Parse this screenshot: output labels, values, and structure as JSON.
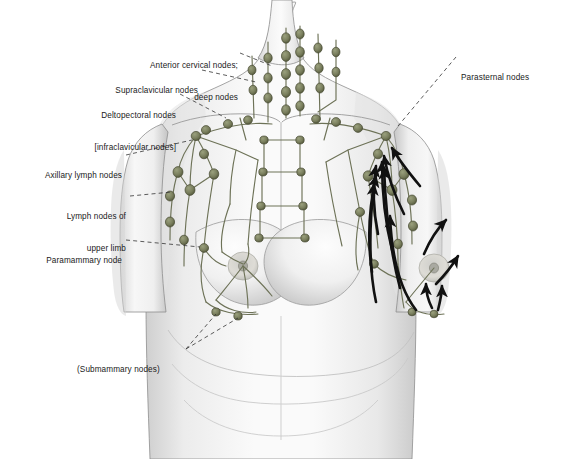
{
  "figure": {
    "background_color": "#ffffff",
    "node_color": "#7a7f5e",
    "node_outline_color": "#474a33",
    "vessel_color": "#6d7257",
    "arrow_color": "#111111",
    "skin_light": "#f4f4f4",
    "skin_shadow": "#c9c9c9",
    "leader_color": "#333333",
    "text_color": "#1a1a1a"
  },
  "labels": {
    "anterior_cervical": {
      "line1": "Anterior cervical nodes;",
      "line2": "deep nodes"
    },
    "supraclavicular": {
      "line1": "Supraclavicular nodes"
    },
    "deltopectoral": {
      "line1": "Deltopectoral nodes",
      "line2": "[infraclavicular nodes]"
    },
    "axillary": {
      "line1": "Axillary lymph nodes"
    },
    "upper_limb": {
      "line1": "Lymph nodes of",
      "line2": "upper limb"
    },
    "paramammary": {
      "line1": "Paramammary node"
    },
    "submammary": {
      "line1": "(Submammary nodes)"
    },
    "parasternal": {
      "line1": "Parasternal nodes"
    }
  }
}
